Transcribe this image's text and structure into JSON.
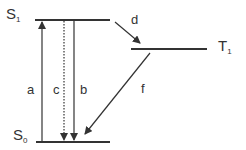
{
  "diagram": {
    "type": "jablonski",
    "levels": {
      "s1": {
        "label": "S",
        "sub": "1"
      },
      "s0": {
        "label": "S",
        "sub": "0"
      },
      "t1": {
        "label": "T",
        "sub": "1"
      }
    },
    "transitions": {
      "a": {
        "label": "a",
        "from": "S0",
        "to": "S1",
        "style": "solid"
      },
      "b": {
        "label": "b",
        "from": "S1",
        "to": "S0",
        "style": "solid"
      },
      "c": {
        "label": "c",
        "from": "S1",
        "to": "S0",
        "style": "dotted"
      },
      "d": {
        "label": "d",
        "from": "S1",
        "to": "T1",
        "style": "solid"
      },
      "f": {
        "label": "f",
        "from": "T1",
        "to": "S0",
        "style": "solid"
      }
    },
    "color": "#333333"
  }
}
